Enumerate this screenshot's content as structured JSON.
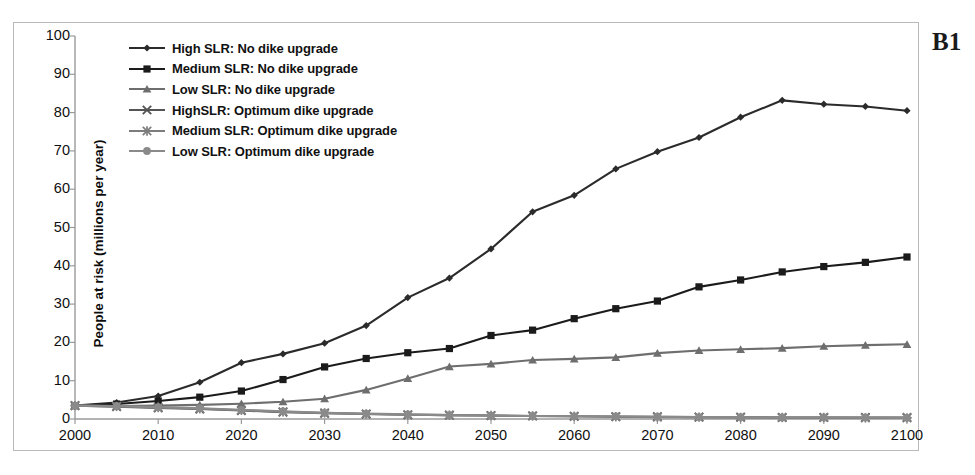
{
  "panel": {
    "label": "B1"
  },
  "chart_data": {
    "type": "line",
    "title": "",
    "subtitle": "",
    "xlabel": "",
    "ylabel": "People at risk (millions per year)",
    "xlim": [
      2000,
      2100
    ],
    "ylim": [
      0,
      100
    ],
    "grid": false,
    "legend_position": "top-left",
    "x": [
      2000,
      2005,
      2010,
      2015,
      2020,
      2025,
      2030,
      2035,
      2040,
      2045,
      2050,
      2055,
      2060,
      2065,
      2070,
      2075,
      2080,
      2085,
      2090,
      2095,
      2100
    ],
    "xticks": [
      2000,
      2010,
      2020,
      2030,
      2040,
      2050,
      2060,
      2070,
      2080,
      2090,
      2100
    ],
    "xtick_labels": [
      "2000",
      "2010",
      "2020",
      "2030",
      "2040",
      "2050",
      "2060",
      "2070",
      "2080",
      "2090",
      "2100"
    ],
    "yticks": [
      0,
      10,
      20,
      30,
      40,
      50,
      60,
      70,
      80,
      90,
      100
    ],
    "ytick_labels": [
      "0",
      "10",
      "20",
      "30",
      "40",
      "50",
      "60",
      "70",
      "80",
      "90",
      "100"
    ],
    "series": [
      {
        "name": "High SLR: No dike upgrade",
        "marker": "diamond",
        "color": "#2b2b2b",
        "values": [
          3.5,
          4.3,
          6.0,
          9.6,
          14.7,
          17.0,
          19.8,
          24.4,
          31.7,
          36.8,
          44.4,
          54.1,
          58.4,
          65.3,
          69.8,
          73.5,
          78.8,
          83.2,
          82.2,
          81.6,
          80.5
        ]
      },
      {
        "name": "Medium SLR: No dike upgrade",
        "marker": "square",
        "color": "#1b1b1b",
        "values": [
          3.5,
          3.9,
          4.7,
          5.7,
          7.3,
          10.3,
          13.6,
          15.8,
          17.3,
          18.4,
          21.8,
          23.2,
          26.2,
          28.8,
          30.8,
          34.5,
          36.3,
          38.4,
          39.8,
          40.9,
          42.3
        ]
      },
      {
        "name": "Low SLR: No dike upgrade",
        "marker": "triangle",
        "color": "#6e6e6e",
        "values": [
          3.5,
          3.4,
          3.5,
          3.7,
          4.0,
          4.5,
          5.3,
          7.6,
          10.6,
          13.7,
          14.4,
          15.4,
          15.7,
          16.1,
          17.2,
          17.9,
          18.2,
          18.5,
          19.0,
          19.3,
          19.5
        ]
      },
      {
        "name": "HighSLR: Optimum dike upgrade",
        "marker": "x",
        "color": "#555555",
        "values": [
          3.5,
          3.2,
          2.9,
          2.6,
          2.2,
          1.8,
          1.5,
          1.3,
          1.1,
          1.0,
          0.9,
          0.8,
          0.7,
          0.6,
          0.6,
          0.5,
          0.5,
          0.4,
          0.4,
          0.4,
          0.4
        ]
      },
      {
        "name": "Medium SLR:  Optimum dike upgrade",
        "marker": "star",
        "color": "#7d7d7d",
        "values": [
          3.5,
          3.3,
          3.0,
          2.7,
          2.3,
          1.9,
          1.6,
          1.3,
          1.1,
          1.0,
          0.9,
          0.8,
          0.7,
          0.6,
          0.5,
          0.5,
          0.4,
          0.4,
          0.4,
          0.3,
          0.3
        ]
      },
      {
        "name": "Low SLR: Optimum dike upgrade",
        "marker": "circle",
        "color": "#8a8a8a",
        "values": [
          3.5,
          3.4,
          3.1,
          2.8,
          2.4,
          2.0,
          1.6,
          1.4,
          1.2,
          1.0,
          0.9,
          0.8,
          0.7,
          0.7,
          0.6,
          0.5,
          0.5,
          0.4,
          0.4,
          0.4,
          0.3
        ]
      }
    ]
  }
}
